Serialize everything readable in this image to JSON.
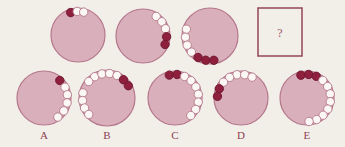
{
  "puzzle": {
    "type": "matrix-reasoning-bead-circles",
    "question_mark": "?",
    "colors": {
      "background": "#f2efe9",
      "disc_fill": "#d9afbb",
      "disc_stroke": "#b5778c",
      "bead_white": "#fbf7f4",
      "bead_white_stroke": "#b5778c",
      "bead_dark": "#8e1f3d",
      "bead_dark_stroke": "#6d1630",
      "box_stroke": "#9a5061",
      "label_text": "#8d4152"
    },
    "sequence": [
      {
        "name": "sequence-circle-1",
        "cx": 78,
        "cy": 35,
        "r": 27,
        "beads": [
          {
            "angle": -108,
            "type": "dark"
          },
          {
            "angle": -92,
            "type": "white"
          },
          {
            "angle": -76,
            "type": "white"
          }
        ],
        "dark_count": 1,
        "white_count": 2,
        "total_count": 3
      },
      {
        "name": "sequence-circle-2",
        "cx": 143,
        "cy": 36,
        "r": 27,
        "beads": [
          {
            "angle": -56,
            "type": "white"
          },
          {
            "angle": -37,
            "type": "white"
          },
          {
            "angle": -18,
            "type": "white"
          },
          {
            "angle": 2,
            "type": "dark"
          },
          {
            "angle": 21,
            "type": "dark"
          }
        ],
        "dark_count": 2,
        "white_count": 3,
        "total_count": 5
      },
      {
        "name": "sequence-circle-3",
        "cx": 210,
        "cy": 36,
        "r": 28,
        "beads": [
          {
            "angle": 196,
            "type": "white"
          },
          {
            "angle": 177,
            "type": "white"
          },
          {
            "angle": 158,
            "type": "white"
          },
          {
            "angle": 139,
            "type": "white"
          },
          {
            "angle": 119,
            "type": "dark"
          },
          {
            "angle": 100,
            "type": "dark"
          },
          {
            "angle": 81,
            "type": "dark"
          }
        ],
        "dark_count": 3,
        "white_count": 4,
        "total_count": 7
      }
    ],
    "answer_box": {
      "name": "answer-placeholder-box",
      "x": 258,
      "y": 8,
      "width": 44,
      "height": 48
    },
    "options": [
      {
        "name": "option-a",
        "label": "A",
        "cx": 44,
        "cy": 98,
        "r": 27,
        "label_x": 44,
        "label_y": 139,
        "beads": [
          {
            "angle": -48,
            "type": "dark"
          },
          {
            "angle": -27,
            "type": "white"
          },
          {
            "angle": -8,
            "type": "white"
          },
          {
            "angle": 12,
            "type": "white"
          },
          {
            "angle": 33,
            "type": "white"
          },
          {
            "angle": 54,
            "type": "white"
          }
        ],
        "dark_count": 1,
        "white_count": 5,
        "total_count": 6
      },
      {
        "name": "option-b",
        "label": "B",
        "cx": 107,
        "cy": 98,
        "r": 28,
        "label_x": 107,
        "label_y": 139,
        "beads": [
          {
            "angle": -120,
            "type": "white"
          },
          {
            "angle": -102,
            "type": "white"
          },
          {
            "angle": -84,
            "type": "white"
          },
          {
            "angle": -66,
            "type": "white"
          },
          {
            "angle": -48,
            "type": "dark"
          },
          {
            "angle": -30,
            "type": "dark"
          },
          {
            "angle": 192,
            "type": "white"
          },
          {
            "angle": 174,
            "type": "white"
          },
          {
            "angle": 156,
            "type": "white"
          },
          {
            "angle": 138,
            "type": "white"
          },
          {
            "angle": -138,
            "type": "white"
          }
        ],
        "dark_count": 2,
        "white_count": 9,
        "total_count": 11
      },
      {
        "name": "option-c",
        "label": "C",
        "cx": 175,
        "cy": 98,
        "r": 27,
        "label_x": 175,
        "label_y": 139,
        "beads": [
          {
            "angle": -104,
            "type": "dark"
          },
          {
            "angle": -85,
            "type": "dark"
          },
          {
            "angle": -66,
            "type": "white"
          },
          {
            "angle": -47,
            "type": "white"
          },
          {
            "angle": -28,
            "type": "white"
          },
          {
            "angle": -9,
            "type": "white"
          },
          {
            "angle": 10,
            "type": "white"
          },
          {
            "angle": 29,
            "type": "white"
          },
          {
            "angle": 48,
            "type": "white"
          }
        ],
        "dark_count": 2,
        "white_count": 7,
        "total_count": 9
      },
      {
        "name": "option-d",
        "label": "D",
        "cx": 241,
        "cy": 98,
        "r": 27,
        "label_x": 241,
        "label_y": 139,
        "beads": [
          {
            "angle": -100,
            "type": "white"
          },
          {
            "angle": -81,
            "type": "white"
          },
          {
            "angle": -62,
            "type": "white"
          },
          {
            "angle": -119,
            "type": "white"
          },
          {
            "angle": -138,
            "type": "white"
          },
          {
            "angle": 203,
            "type": "dark"
          },
          {
            "angle": 184,
            "type": "dark"
          }
        ],
        "dark_count": 2,
        "white_count": 5,
        "total_count": 7
      },
      {
        "name": "option-e",
        "label": "E",
        "cx": 307,
        "cy": 98,
        "r": 27,
        "label_x": 307,
        "label_y": 139,
        "beads": [
          {
            "angle": -105,
            "type": "dark"
          },
          {
            "angle": -86,
            "type": "dark"
          },
          {
            "angle": -67,
            "type": "dark"
          },
          {
            "angle": -48,
            "type": "white"
          },
          {
            "angle": -29,
            "type": "white"
          },
          {
            "angle": -10,
            "type": "white"
          },
          {
            "angle": 9,
            "type": "white"
          },
          {
            "angle": 28,
            "type": "white"
          },
          {
            "angle": 47,
            "type": "white"
          },
          {
            "angle": 66,
            "type": "white"
          },
          {
            "angle": 85,
            "type": "white"
          }
        ],
        "dark_count": 3,
        "white_count": 8,
        "total_count": 11
      }
    ]
  }
}
